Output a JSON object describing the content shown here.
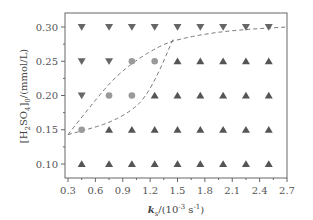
{
  "chart_data": {
    "type": "scatter",
    "title": "",
    "xlabel": "k_s/(10^-3 s^-1)",
    "ylabel": "[H2SO4]0/(mmol/L)",
    "xlabel_parts": {
      "main": "k",
      "sub": "s",
      "rest": "/(10",
      "sup": "-3",
      "unit": " s",
      "unit_sup": "-1",
      "close": ")"
    },
    "ylabel_parts": {
      "pre": "[H",
      "sub1": "2",
      "mid": "SO",
      "sub2": "4",
      "post": "]",
      "sub3": "0",
      "rest": "/(mmol/L)"
    },
    "xlim": [
      0.3,
      2.7
    ],
    "ylim": [
      0.08,
      0.32
    ],
    "xticks": [
      "0.3",
      "0.6",
      "0.9",
      "1.2",
      "1.5",
      "1.8",
      "2.1",
      "2.4",
      "2.7"
    ],
    "yticks": [
      "0.10",
      "0.15",
      "0.20",
      "0.25",
      "0.30"
    ],
    "grid": false,
    "legend": null,
    "x_columns": [
      0.45,
      0.75,
      1.0,
      1.25,
      1.5,
      1.75,
      2.0,
      2.25,
      2.5
    ],
    "series": [
      {
        "name": "down-triangle",
        "marker": "triangle-down",
        "color": "#666666",
        "points": [
          [
            0.45,
            0.3
          ],
          [
            0.75,
            0.3
          ],
          [
            1.0,
            0.3
          ],
          [
            1.25,
            0.3
          ],
          [
            1.5,
            0.3
          ],
          [
            1.75,
            0.3
          ],
          [
            2.0,
            0.3
          ],
          [
            2.25,
            0.3
          ],
          [
            2.5,
            0.3
          ],
          [
            0.45,
            0.25
          ],
          [
            0.75,
            0.25
          ],
          [
            0.45,
            0.2
          ]
        ]
      },
      {
        "name": "circle",
        "marker": "circle",
        "color": "#9a9a9a",
        "points": [
          [
            1.0,
            0.25
          ],
          [
            1.25,
            0.25
          ],
          [
            0.75,
            0.2
          ],
          [
            1.0,
            0.2
          ],
          [
            0.45,
            0.15
          ]
        ]
      },
      {
        "name": "up-triangle",
        "marker": "triangle-up",
        "color": "#555555",
        "points": [
          [
            1.5,
            0.25
          ],
          [
            1.75,
            0.25
          ],
          [
            2.0,
            0.25
          ],
          [
            2.25,
            0.25
          ],
          [
            2.5,
            0.25
          ],
          [
            1.25,
            0.2
          ],
          [
            1.5,
            0.2
          ],
          [
            1.75,
            0.2
          ],
          [
            2.0,
            0.2
          ],
          [
            2.25,
            0.2
          ],
          [
            2.5,
            0.2
          ],
          [
            0.75,
            0.15
          ],
          [
            1.0,
            0.15
          ],
          [
            1.25,
            0.15
          ],
          [
            1.5,
            0.15
          ],
          [
            1.75,
            0.15
          ],
          [
            2.0,
            0.15
          ],
          [
            2.25,
            0.15
          ],
          [
            2.5,
            0.15
          ],
          [
            0.45,
            0.1
          ],
          [
            0.75,
            0.1
          ],
          [
            1.0,
            0.1
          ],
          [
            1.25,
            0.1
          ],
          [
            1.5,
            0.1
          ],
          [
            1.75,
            0.1
          ],
          [
            2.0,
            0.1
          ],
          [
            2.25,
            0.1
          ],
          [
            2.5,
            0.1
          ]
        ]
      }
    ],
    "boundary_curves": [
      {
        "name": "upper-boundary",
        "style": "dashed",
        "color": "#777777",
        "points": [
          [
            0.3,
            0.143
          ],
          [
            0.55,
            0.185
          ],
          [
            0.8,
            0.225
          ],
          [
            1.05,
            0.252
          ],
          [
            1.3,
            0.272
          ],
          [
            1.5,
            0.282
          ],
          [
            1.9,
            0.292
          ],
          [
            2.3,
            0.297
          ],
          [
            2.7,
            0.3
          ]
        ]
      },
      {
        "name": "lower-boundary",
        "style": "dashed",
        "color": "#777777",
        "points": [
          [
            0.3,
            0.143
          ],
          [
            0.5,
            0.15
          ],
          [
            0.75,
            0.16
          ],
          [
            1.0,
            0.178
          ],
          [
            1.15,
            0.198
          ],
          [
            1.3,
            0.235
          ],
          [
            1.45,
            0.282
          ]
        ]
      }
    ]
  }
}
